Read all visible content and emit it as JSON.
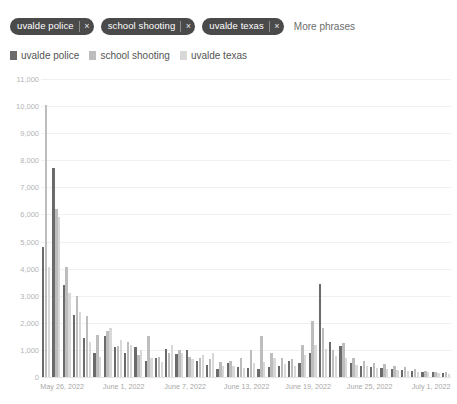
{
  "phrase_bar": {
    "chips": [
      {
        "label": "uvalde police",
        "remove_icon": "close-icon",
        "remove_glyph": "×"
      },
      {
        "label": "school shooting",
        "remove_icon": "close-icon",
        "remove_glyph": "×"
      },
      {
        "label": "uvalde texas",
        "remove_icon": "close-icon",
        "remove_glyph": "×"
      }
    ],
    "more_label": "More phrases"
  },
  "legend": {
    "items": [
      {
        "label": "uvalde police",
        "color": "#6b6b6b"
      },
      {
        "label": "school shooting",
        "color": "#bdbdbd"
      },
      {
        "label": "uvalde texas",
        "color": "#d8d8d8"
      }
    ]
  },
  "chart_data": {
    "type": "bar",
    "title": "",
    "xlabel": "",
    "ylabel": "",
    "ylim": [
      0,
      11000
    ],
    "grid": true,
    "legend_position": "top-left",
    "y_ticks": [
      "0",
      "1,000",
      "2,000",
      "3,000",
      "4,000",
      "5,000",
      "6,000",
      "7,000",
      "8,000",
      "9,000",
      "10,000",
      "11,000"
    ],
    "y_tick_values": [
      0,
      1000,
      2000,
      3000,
      4000,
      5000,
      6000,
      7000,
      8000,
      9000,
      10000,
      11000
    ],
    "x_tick_labels": [
      "May 26, 2022",
      "June 1, 2022",
      "June 7, 2022",
      "June 13, 2022",
      "June 19, 2022",
      "June 25, 2022",
      "July 1, 2022"
    ],
    "x_tick_indices": [
      0,
      6,
      12,
      18,
      24,
      30,
      36
    ],
    "categories": [
      "May 26, 2022",
      "May 27, 2022",
      "May 28, 2022",
      "May 29, 2022",
      "May 30, 2022",
      "May 31, 2022",
      "June 1, 2022",
      "June 2, 2022",
      "June 3, 2022",
      "June 4, 2022",
      "June 5, 2022",
      "June 6, 2022",
      "June 7, 2022",
      "June 8, 2022",
      "June 9, 2022",
      "June 10, 2022",
      "June 11, 2022",
      "June 12, 2022",
      "June 13, 2022",
      "June 14, 2022",
      "June 15, 2022",
      "June 16, 2022",
      "June 17, 2022",
      "June 18, 2022",
      "June 19, 2022",
      "June 20, 2022",
      "June 21, 2022",
      "June 22, 2022",
      "June 23, 2022",
      "June 24, 2022",
      "June 25, 2022",
      "June 26, 2022",
      "June 27, 2022",
      "June 28, 2022",
      "June 29, 2022",
      "June 30, 2022",
      "July 1, 2022",
      "July 2, 2022",
      "July 3, 2022",
      "July 4, 2022"
    ],
    "series": [
      {
        "name": "uvalde police",
        "color": "#6b6b6b",
        "values": [
          4800,
          7700,
          3400,
          2300,
          1450,
          900,
          1500,
          1100,
          900,
          1100,
          600,
          700,
          1050,
          850,
          1000,
          600,
          450,
          300,
          500,
          380,
          330,
          300,
          380,
          420,
          600,
          520,
          900,
          3450,
          1300,
          1150,
          500,
          420,
          380,
          330,
          300,
          270,
          240,
          200,
          180,
          150
        ]
      },
      {
        "name": "school shooting",
        "color": "#bdbdbd",
        "values": [
          10050,
          6200,
          4050,
          3000,
          2250,
          1550,
          1700,
          1150,
          1300,
          800,
          1500,
          750,
          900,
          1000,
          750,
          700,
          650,
          550,
          600,
          700,
          1000,
          1500,
          900,
          700,
          650,
          1200,
          2050,
          1800,
          1000,
          1250,
          700,
          600,
          520,
          470,
          420,
          380,
          280,
          230,
          200,
          170
        ]
      },
      {
        "name": "uvalde texas",
        "color": "#d8d8d8",
        "values": [
          4050,
          5900,
          3100,
          2400,
          1300,
          750,
          1800,
          1350,
          1200,
          1000,
          700,
          550,
          1200,
          900,
          650,
          800,
          900,
          400,
          420,
          350,
          520,
          550,
          700,
          480,
          420,
          800,
          1200,
          1050,
          780,
          720,
          450,
          400,
          350,
          300,
          270,
          240,
          200,
          180,
          150,
          120
        ]
      }
    ]
  }
}
